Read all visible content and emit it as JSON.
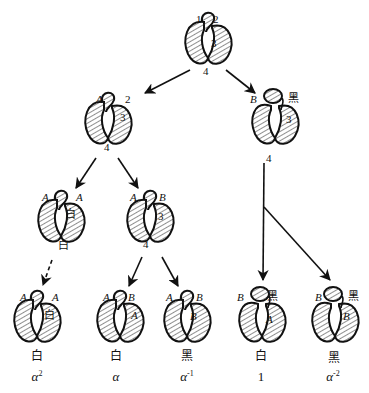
{
  "root": {
    "labels": {
      "top_left": "1",
      "top_right": "2",
      "right": "3",
      "bottom": "4"
    }
  },
  "level1": [
    {
      "id": "L1-left",
      "labels": {
        "top_left": "A",
        "top_right": "2",
        "right": "3",
        "bottom": "4"
      }
    },
    {
      "id": "L1-right",
      "labels": {
        "top_left": "B",
        "top_right": "黑",
        "right": "3",
        "bottom": "4"
      }
    }
  ],
  "level2": [
    {
      "id": "L2-a",
      "labels": {
        "top_left": "A",
        "top_right": "A",
        "right": "白",
        "bottom": "白"
      },
      "arrow_style": "dashed"
    },
    {
      "id": "L2-b",
      "labels": {
        "top_left": "A",
        "top_right": "B",
        "right": "3",
        "bottom": "4"
      }
    }
  ],
  "leaves": [
    {
      "id": "leaf-1",
      "labels": {
        "top_left": "A",
        "top_right": "A",
        "right": "白"
      },
      "caption": "白",
      "power_base": "α",
      "power_exp": "2"
    },
    {
      "id": "leaf-2",
      "labels": {
        "top_left": "A",
        "top_right": "B",
        "right": "A"
      },
      "caption": "白",
      "power_base": "α",
      "power_exp": ""
    },
    {
      "id": "leaf-3",
      "labels": {
        "top_left": "A",
        "top_right": "B",
        "right": "B"
      },
      "caption": "黑",
      "power_base": "α",
      "power_exp": "-1"
    },
    {
      "id": "leaf-4",
      "labels": {
        "top_left": "B",
        "top_right": "黑",
        "right": "A"
      },
      "caption": "白",
      "power_base": "1",
      "power_exp": ""
    },
    {
      "id": "leaf-5",
      "labels": {
        "top_left": "B",
        "top_right": "黑",
        "right": "B"
      },
      "caption": "黑",
      "power_base": "α",
      "power_exp": "-2"
    }
  ],
  "colors": {
    "ink": "#111111",
    "hatch": "#333333",
    "background": "#ffffff"
  }
}
